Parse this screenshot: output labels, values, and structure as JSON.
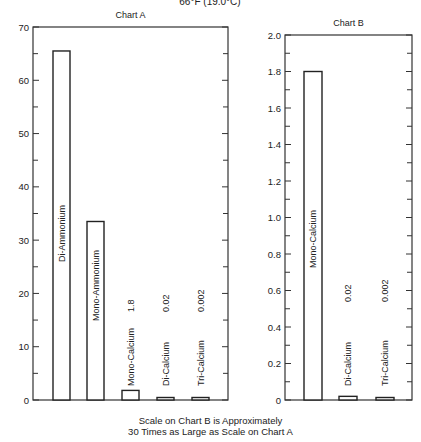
{
  "top_cut_label": "66°F (19.0°C)",
  "footnote": {
    "line1": "Scale on Chart B is Approximately",
    "line2": "30 Times as Large as Scale on Chart A"
  },
  "chart_data": [
    {
      "type": "bar",
      "title": "Chart A",
      "xlabel": "",
      "ylabel": "",
      "ylim": [
        0,
        70
      ],
      "yticks": [
        0,
        10,
        20,
        30,
        40,
        50,
        60,
        70
      ],
      "grid": false,
      "categories": [
        "Di-Ammonium",
        "Mono-Ammonium",
        "Mono-Calcium",
        "Di-Calcium",
        "Tri-Calcium"
      ],
      "values": [
        65.5,
        33.5,
        1.8,
        0.02,
        0.002
      ],
      "value_labels": [
        "",
        "",
        "1.8",
        "0.02",
        "0.002"
      ]
    },
    {
      "type": "bar",
      "title": "Chart B",
      "xlabel": "",
      "ylabel": "",
      "ylim": [
        0,
        2.0
      ],
      "yticks": [
        "0",
        "0.2",
        "0.4",
        "0.6",
        "0.8",
        "1.0",
        "1.2",
        "1.4",
        "1.6",
        "1.8",
        "2.0"
      ],
      "grid": false,
      "categories": [
        "Mono-Calcium",
        "Di-Calcium",
        "Tri-Calcium"
      ],
      "values": [
        1.8,
        0.02,
        0.002
      ],
      "value_labels": [
        "",
        "0.02",
        "0.002"
      ]
    }
  ]
}
